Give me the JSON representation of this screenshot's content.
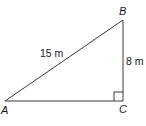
{
  "figure": {
    "type": "right-triangle",
    "stroke_color": "#3a3a3a",
    "vertices": {
      "A": {
        "label": "A",
        "x": 5,
        "y": 101
      },
      "B": {
        "label": "B",
        "x": 123,
        "y": 20
      },
      "C": {
        "label": "C",
        "x": 123,
        "y": 101
      }
    },
    "sides": {
      "AB": {
        "label": "15 m",
        "length": 15,
        "unit": "m",
        "role": "hypotenuse"
      },
      "BC": {
        "label": "8 m",
        "length": 8,
        "unit": "m",
        "role": "leg"
      },
      "AC": {
        "label": "",
        "role": "leg"
      }
    },
    "right_angle_at": "C"
  }
}
